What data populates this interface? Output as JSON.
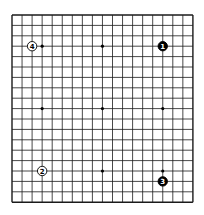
{
  "board": {
    "size": 19,
    "origin_x": 12,
    "origin_y": 15,
    "spacing_x": 10.05,
    "spacing_y": 10.4,
    "line_color": "#1a1a1a",
    "background_color": "#ffffff",
    "star_points": [
      [
        3,
        3
      ],
      [
        9,
        3
      ],
      [
        15,
        3
      ],
      [
        3,
        9
      ],
      [
        9,
        9
      ],
      [
        15,
        9
      ],
      [
        3,
        15
      ],
      [
        9,
        15
      ],
      [
        15,
        15
      ]
    ]
  },
  "stones": [
    {
      "move": "1",
      "color": "black",
      "col": 15,
      "row": 3
    },
    {
      "move": "2",
      "color": "white",
      "col": 3,
      "row": 15
    },
    {
      "move": "3",
      "color": "black",
      "col": 15,
      "row": 16
    },
    {
      "move": "4",
      "color": "white",
      "col": 2,
      "row": 3
    }
  ]
}
